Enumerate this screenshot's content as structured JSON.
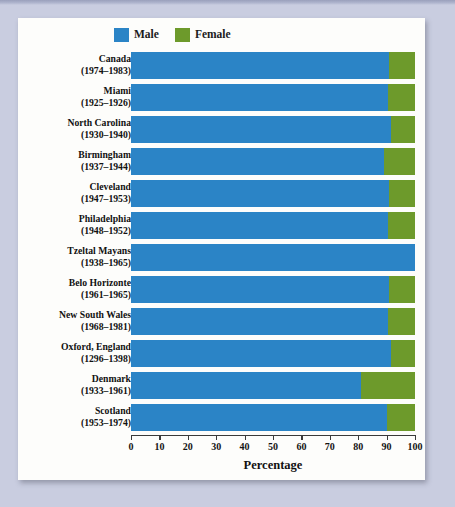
{
  "figure": {
    "axis_title": "Percentage",
    "colors": {
      "male": "#2b84c6",
      "female": "#6d9a2b",
      "panel_background": "#fdfdfb",
      "page_background": "#c9cde0"
    }
  },
  "legend": {
    "position": "top-left",
    "entries": [
      {
        "label": "Male",
        "color": "#2b84c6",
        "swatch": "male-swatch"
      },
      {
        "label": "Female",
        "color": "#6d9a2b",
        "swatch": "female-swatch"
      }
    ]
  },
  "chart_data": {
    "type": "bar",
    "orientation": "horizontal",
    "stacked": true,
    "title": "",
    "subtitle": "",
    "xlabel": "Percentage",
    "ylabel": "",
    "xlim": [
      0,
      100
    ],
    "grid": false,
    "legend_position": "top-left",
    "xticks": [
      0,
      10,
      20,
      30,
      40,
      50,
      60,
      70,
      80,
      90,
      100
    ],
    "xticklabels": [
      "0",
      "10",
      "20",
      "30",
      "40",
      "50",
      "60",
      "70",
      "80",
      "90",
      "100"
    ],
    "categories": [
      "Canada (1974–1983)",
      "Miami (1925–1926)",
      "North Carolina (1930–1940)",
      "Birmingham (1937–1944)",
      "Cleveland (1947–1953)",
      "Philadelphia (1948–1952)",
      "Tzeltal Mayans (1938–1965)",
      "Belo Horizonte (1961–1965)",
      "New South Wales (1968–1981)",
      "Oxford, England (1296–1398)",
      "Denmark (1933–1961)",
      "Scotland (1953–1974)"
    ],
    "series": [
      {
        "name": "Male",
        "values": [
          91,
          90.5,
          91.5,
          89,
          91,
          90.5,
          100,
          91,
          90.5,
          91.5,
          81,
          90
        ]
      },
      {
        "name": "Female",
        "values": [
          9,
          9.5,
          8.5,
          11,
          9,
          9.5,
          0,
          9,
          9.5,
          8.5,
          19,
          10
        ]
      }
    ]
  },
  "rows": [
    {
      "place": "Canada",
      "years": "(1974–1983)",
      "male": 91,
      "female": 9
    },
    {
      "place": "Miami",
      "years": "(1925–1926)",
      "male": 90.5,
      "female": 9.5
    },
    {
      "place": "North Carolina",
      "years": "(1930–1940)",
      "male": 91.5,
      "female": 8.5
    },
    {
      "place": "Birmingham",
      "years": "(1937–1944)",
      "male": 89,
      "female": 11
    },
    {
      "place": "Cleveland",
      "years": "(1947–1953)",
      "male": 91,
      "female": 9
    },
    {
      "place": "Philadelphia",
      "years": "(1948–1952)",
      "male": 90.5,
      "female": 9.5
    },
    {
      "place": "Tzeltal Mayans",
      "years": "(1938–1965)",
      "male": 100,
      "female": 0
    },
    {
      "place": "Belo Horizonte",
      "years": "(1961–1965)",
      "male": 91,
      "female": 9
    },
    {
      "place": "New South Wales",
      "years": "(1968–1981)",
      "male": 90.5,
      "female": 9.5
    },
    {
      "place": "Oxford, England",
      "years": "(1296–1398)",
      "male": 91.5,
      "female": 8.5
    },
    {
      "place": "Denmark",
      "years": "(1933–1961)",
      "male": 81,
      "female": 19
    },
    {
      "place": "Scotland",
      "years": "(1953–1974)",
      "male": 90,
      "female": 10
    }
  ]
}
